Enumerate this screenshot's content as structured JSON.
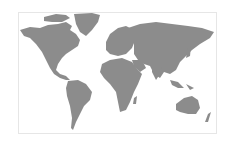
{
  "map": {
    "type": "world-map",
    "style": "halftone-silhouette",
    "land_color": "#8c8c8c",
    "background_color": "#ffffff",
    "border_color": "#e6e6e6",
    "regions": [
      "North America",
      "Greenland",
      "South America",
      "Europe",
      "Africa",
      "Asia",
      "Australia",
      "New Zealand"
    ]
  }
}
